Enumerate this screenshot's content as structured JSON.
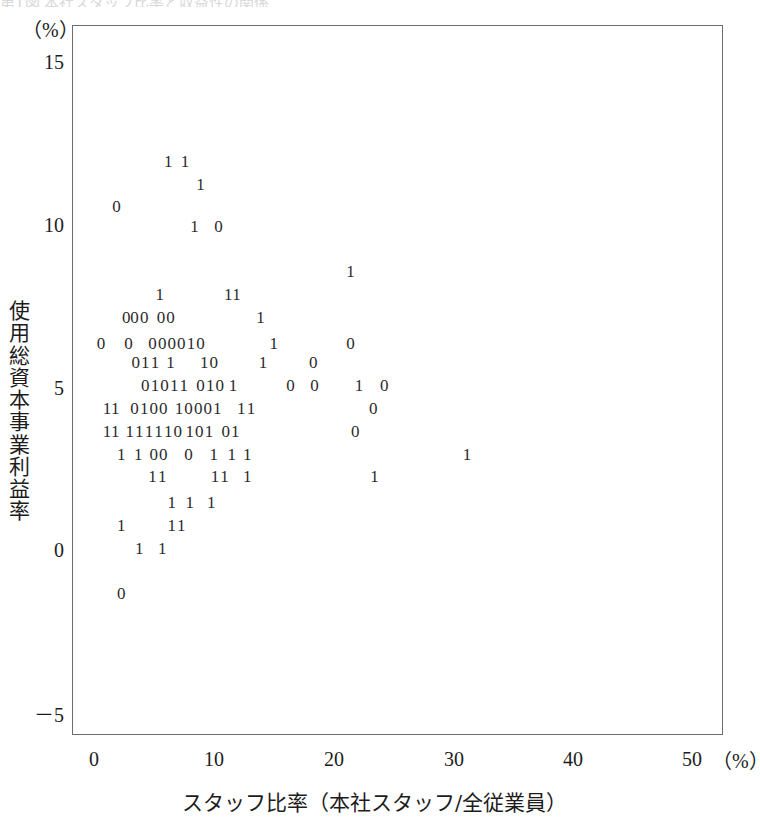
{
  "figure": {
    "background_color": "#ffffff",
    "frame_color": "#6d6d6d",
    "marker_color": "#2b2b2b",
    "top_sliver_text": "第1図 本社スタッフ比率と収益性の関係"
  },
  "axes": {
    "y_unit_label": "（%）",
    "x_unit_label": "（%）",
    "y_title": "使用総資本事業利益率",
    "x_title": "スタッフ比率（本社スタッフ/全従業員）",
    "y_ticks": [
      "15",
      "10",
      "5",
      "0",
      "－5"
    ],
    "x_ticks": [
      "0",
      "10",
      "20",
      "30",
      "40",
      "50"
    ]
  },
  "chart_data": {
    "type": "scatter",
    "title": "",
    "xlabel": "スタッフ比率（本社スタッフ/全従業員）",
    "ylabel": "使用総資本事業利益率",
    "xunit": "%",
    "yunit": "%",
    "xlim": [
      -1.83,
      52.42
    ],
    "ylim": [
      -5.69,
      16.15
    ],
    "xticks": [
      0,
      10,
      20,
      30,
      40,
      50
    ],
    "yticks": [
      -5,
      0,
      5,
      10,
      15
    ],
    "grid": false,
    "legend": null,
    "marker_style": "digit-glyph",
    "marker_labels": [
      "0",
      "1"
    ],
    "points": [
      {
        "label": "1",
        "x": 6.1,
        "y": 12.0
      },
      {
        "label": "1",
        "x": 7.5,
        "y": 12.0
      },
      {
        "label": "1",
        "x": 8.8,
        "y": 11.3
      },
      {
        "label": "0",
        "x": 1.8,
        "y": 10.6
      },
      {
        "label": "1",
        "x": 8.3,
        "y": 10.0
      },
      {
        "label": "0",
        "x": 10.3,
        "y": 10.0
      },
      {
        "label": "1",
        "x": 21.3,
        "y": 8.6
      },
      {
        "label": "1",
        "x": 5.4,
        "y": 7.9
      },
      {
        "label": "1",
        "x": 11.1,
        "y": 7.9
      },
      {
        "label": "1",
        "x": 11.8,
        "y": 7.9
      },
      {
        "label": "0",
        "x": 2.6,
        "y": 7.2
      },
      {
        "label": "0",
        "x": 3.3,
        "y": 7.2
      },
      {
        "label": "0",
        "x": 4.1,
        "y": 7.2
      },
      {
        "label": "0",
        "x": 5.5,
        "y": 7.2
      },
      {
        "label": "0",
        "x": 6.3,
        "y": 7.2
      },
      {
        "label": "1",
        "x": 13.8,
        "y": 7.2
      },
      {
        "label": "0",
        "x": 0.5,
        "y": 6.4
      },
      {
        "label": "0",
        "x": 2.8,
        "y": 6.4
      },
      {
        "label": "0",
        "x": 4.8,
        "y": 6.4
      },
      {
        "label": "0",
        "x": 5.6,
        "y": 6.4
      },
      {
        "label": "0",
        "x": 6.4,
        "y": 6.4
      },
      {
        "label": "0",
        "x": 7.2,
        "y": 6.4
      },
      {
        "label": "1",
        "x": 8.0,
        "y": 6.4
      },
      {
        "label": "0",
        "x": 8.8,
        "y": 6.4
      },
      {
        "label": "1",
        "x": 14.9,
        "y": 6.4
      },
      {
        "label": "0",
        "x": 21.3,
        "y": 6.4
      },
      {
        "label": "0",
        "x": 3.4,
        "y": 5.8
      },
      {
        "label": "1",
        "x": 4.2,
        "y": 5.8
      },
      {
        "label": "1",
        "x": 5.0,
        "y": 5.8
      },
      {
        "label": "1",
        "x": 6.3,
        "y": 5.8
      },
      {
        "label": "1",
        "x": 9.1,
        "y": 5.8
      },
      {
        "label": "0",
        "x": 9.9,
        "y": 5.8
      },
      {
        "label": "1",
        "x": 14.0,
        "y": 5.8
      },
      {
        "label": "0",
        "x": 18.2,
        "y": 5.8
      },
      {
        "label": "0",
        "x": 4.2,
        "y": 5.1
      },
      {
        "label": "1",
        "x": 5.0,
        "y": 5.1
      },
      {
        "label": "0",
        "x": 5.8,
        "y": 5.1
      },
      {
        "label": "1",
        "x": 6.6,
        "y": 5.1
      },
      {
        "label": "1",
        "x": 7.4,
        "y": 5.1
      },
      {
        "label": "0",
        "x": 8.8,
        "y": 5.1
      },
      {
        "label": "1",
        "x": 9.6,
        "y": 5.1
      },
      {
        "label": "0",
        "x": 10.4,
        "y": 5.1
      },
      {
        "label": "1",
        "x": 11.5,
        "y": 5.1
      },
      {
        "label": "0",
        "x": 16.3,
        "y": 5.1
      },
      {
        "label": "0",
        "x": 18.3,
        "y": 5.1
      },
      {
        "label": "1",
        "x": 22.0,
        "y": 5.1
      },
      {
        "label": "0",
        "x": 24.1,
        "y": 5.1
      },
      {
        "label": "1",
        "x": 1.0,
        "y": 4.4
      },
      {
        "label": "1",
        "x": 1.7,
        "y": 4.4
      },
      {
        "label": "0",
        "x": 3.3,
        "y": 4.4
      },
      {
        "label": "1",
        "x": 4.1,
        "y": 4.4
      },
      {
        "label": "0",
        "x": 4.9,
        "y": 4.4
      },
      {
        "label": "0",
        "x": 5.7,
        "y": 4.4
      },
      {
        "label": "1",
        "x": 7.0,
        "y": 4.4
      },
      {
        "label": "0",
        "x": 7.8,
        "y": 4.4
      },
      {
        "label": "0",
        "x": 8.6,
        "y": 4.4
      },
      {
        "label": "0",
        "x": 9.4,
        "y": 4.4
      },
      {
        "label": "1",
        "x": 10.2,
        "y": 4.4
      },
      {
        "label": "1",
        "x": 12.2,
        "y": 4.4
      },
      {
        "label": "1",
        "x": 13.0,
        "y": 4.4
      },
      {
        "label": "0",
        "x": 23.2,
        "y": 4.4
      },
      {
        "label": "1",
        "x": 1.0,
        "y": 3.7
      },
      {
        "label": "1",
        "x": 1.7,
        "y": 3.7
      },
      {
        "label": "1",
        "x": 2.9,
        "y": 3.7
      },
      {
        "label": "1",
        "x": 3.7,
        "y": 3.7
      },
      {
        "label": "1",
        "x": 4.5,
        "y": 3.7
      },
      {
        "label": "1",
        "x": 5.3,
        "y": 3.7
      },
      {
        "label": "1",
        "x": 6.1,
        "y": 3.7
      },
      {
        "label": "0",
        "x": 6.9,
        "y": 3.7
      },
      {
        "label": "1",
        "x": 7.9,
        "y": 3.7
      },
      {
        "label": "0",
        "x": 8.7,
        "y": 3.7
      },
      {
        "label": "1",
        "x": 9.5,
        "y": 3.7
      },
      {
        "label": "0",
        "x": 10.9,
        "y": 3.7
      },
      {
        "label": "1",
        "x": 11.7,
        "y": 3.7
      },
      {
        "label": "0",
        "x": 21.7,
        "y": 3.7
      },
      {
        "label": "1",
        "x": 2.2,
        "y": 3.0
      },
      {
        "label": "1",
        "x": 3.6,
        "y": 3.0
      },
      {
        "label": "0",
        "x": 4.9,
        "y": 3.0
      },
      {
        "label": "0",
        "x": 5.7,
        "y": 3.0
      },
      {
        "label": "0",
        "x": 7.8,
        "y": 3.0
      },
      {
        "label": "1",
        "x": 9.9,
        "y": 3.0
      },
      {
        "label": "1",
        "x": 11.4,
        "y": 3.0
      },
      {
        "label": "1",
        "x": 12.7,
        "y": 3.0
      },
      {
        "label": "1",
        "x": 31.0,
        "y": 3.0
      },
      {
        "label": "1",
        "x": 4.8,
        "y": 2.3
      },
      {
        "label": "1",
        "x": 5.6,
        "y": 2.3
      },
      {
        "label": "1",
        "x": 10.0,
        "y": 2.3
      },
      {
        "label": "1",
        "x": 10.8,
        "y": 2.3
      },
      {
        "label": "1",
        "x": 12.7,
        "y": 2.3
      },
      {
        "label": "1",
        "x": 23.3,
        "y": 2.3
      },
      {
        "label": "1",
        "x": 6.4,
        "y": 1.5
      },
      {
        "label": "1",
        "x": 7.9,
        "y": 1.5
      },
      {
        "label": "1",
        "x": 9.7,
        "y": 1.5
      },
      {
        "label": "1",
        "x": 2.2,
        "y": 0.8
      },
      {
        "label": "1",
        "x": 6.4,
        "y": 0.8
      },
      {
        "label": "1",
        "x": 7.2,
        "y": 0.8
      },
      {
        "label": "1",
        "x": 3.7,
        "y": 0.1
      },
      {
        "label": "1",
        "x": 5.6,
        "y": 0.1
      },
      {
        "label": "0",
        "x": 2.2,
        "y": -1.3
      }
    ]
  }
}
